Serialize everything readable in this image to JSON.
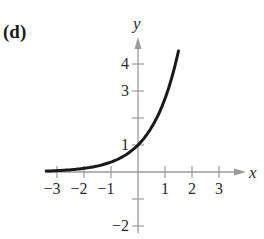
{
  "panel_label": "(d)",
  "chart_data": {
    "type": "line",
    "title": "",
    "xlabel": "x",
    "ylabel": "y",
    "xlim": [
      -3.4,
      3.5
    ],
    "ylim": [
      -2.3,
      4.8
    ],
    "grid": false,
    "x_ticks": [
      -3,
      -2,
      -1,
      1,
      2,
      3
    ],
    "x_tick_labels": [
      "−3",
      "−2",
      "−1",
      "1",
      "2",
      "3"
    ],
    "y_ticks": [
      -2,
      1,
      3,
      4
    ],
    "y_tick_labels": [
      "−2",
      "1",
      "3",
      "4"
    ],
    "y_minor_ticks": [
      -1,
      2
    ],
    "series": [
      {
        "name": "f(x) = e^x",
        "x": [
          -3.4,
          -3,
          -2.5,
          -2,
          -1.5,
          -1,
          -0.5,
          0,
          0.5,
          1,
          1.25,
          1.5
        ],
        "values": [
          0.03,
          0.05,
          0.08,
          0.14,
          0.22,
          0.37,
          0.61,
          1.0,
          1.65,
          2.72,
          3.49,
          4.48
        ]
      }
    ],
    "annotations": [
      "curve passes through (0, 1)",
      "horizontal asymptote y = 0"
    ]
  },
  "colors": {
    "axis": "#9a9a9a",
    "curve": "#1a1a1a",
    "text": "#2a2a2a"
  }
}
